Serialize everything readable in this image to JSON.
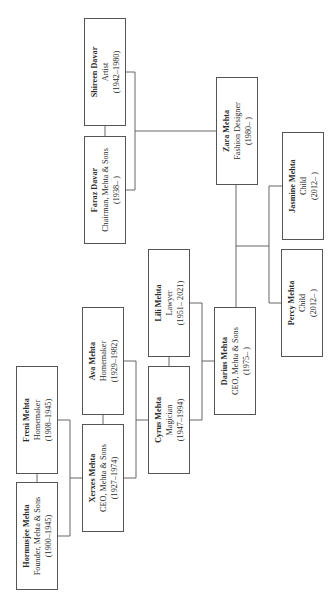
{
  "diagram": {
    "type": "family-tree",
    "orientation": "rotated-90-ccw",
    "line_color": "#555555",
    "box_border_color": "#555555",
    "people": [
      {
        "id": "hormusjee",
        "name": "Hormusjee Mehta",
        "role": "Founder, Mehta & Sons",
        "years": "(1900–1945)",
        "box": {
          "x": 16,
          "y": 482,
          "w": 42,
          "h": 108
        }
      },
      {
        "id": "freni",
        "name": "Freni Mehta",
        "role": "Homemaker",
        "years": "(1908–1945)",
        "box": {
          "x": 16,
          "y": 366,
          "w": 42,
          "h": 108
        }
      },
      {
        "id": "xerxes",
        "name": "Xerxes Mehta",
        "role": "CEO, Mehta & Sons",
        "years": "(1927–1974)",
        "box": {
          "x": 82,
          "y": 424,
          "w": 42,
          "h": 108
        }
      },
      {
        "id": "ava",
        "name": "Ava Mehta",
        "role": "Homemaker",
        "years": "(1929–1982)",
        "box": {
          "x": 82,
          "y": 307,
          "w": 42,
          "h": 108
        }
      },
      {
        "id": "cyrus",
        "name": "Cyrus Mehta",
        "role": "Magician",
        "years": "(1947–1994)",
        "box": {
          "x": 148,
          "y": 366,
          "w": 42,
          "h": 108
        }
      },
      {
        "id": "lili",
        "name": "Lili Mehta",
        "role": "Lawyer",
        "years": "(1951– 2021)",
        "box": {
          "x": 148,
          "y": 249,
          "w": 42,
          "h": 108
        }
      },
      {
        "id": "darius",
        "name": "Darius Mehta",
        "role": "CEO, Mehta & Sons",
        "years": "(1975–   )",
        "box": {
          "x": 214,
          "y": 307,
          "w": 42,
          "h": 108
        }
      },
      {
        "id": "faraz",
        "name": "Faraz Davar",
        "role": "Chairman, Mehta & Sons",
        "years": "(1938–   )",
        "box": {
          "x": 84,
          "y": 136,
          "w": 42,
          "h": 108
        }
      },
      {
        "id": "shireen",
        "name": "Shireen Davar",
        "role": "Artist",
        "years": "(1942–1980)",
        "box": {
          "x": 84,
          "y": 18,
          "w": 42,
          "h": 108
        }
      },
      {
        "id": "zara",
        "name": "Zara Mehta",
        "role": "Fashion Designer",
        "years": "(1980–   )",
        "box": {
          "x": 216,
          "y": 77,
          "w": 42,
          "h": 108
        }
      },
      {
        "id": "jasmine",
        "name": "Jasmine Mehta",
        "role": "Child",
        "years": "(2012–   )",
        "box": {
          "x": 282,
          "y": 132,
          "w": 42,
          "h": 108
        }
      },
      {
        "id": "percy",
        "name": "Percy Mehta",
        "role": "Child",
        "years": "(2012–   )",
        "box": {
          "x": 281,
          "y": 249,
          "w": 42,
          "h": 108
        }
      }
    ],
    "links": [
      {
        "from": "hormusjee",
        "to": "freni",
        "kind": "spouse"
      },
      {
        "from": "xerxes",
        "to": "ava",
        "kind": "spouse"
      },
      {
        "from": "cyrus",
        "to": "lili",
        "kind": "spouse"
      },
      {
        "from": "faraz",
        "to": "shireen",
        "kind": "spouse"
      },
      {
        "from": "darius",
        "to": "zara",
        "kind": "spouse"
      },
      {
        "parents": [
          "hormusjee",
          "freni"
        ],
        "child": "xerxes",
        "kind": "parent-child"
      },
      {
        "parents": [
          "xerxes",
          "ava"
        ],
        "child": "cyrus",
        "kind": "parent-child"
      },
      {
        "parents": [
          "cyrus",
          "lili"
        ],
        "child": "darius",
        "kind": "parent-child"
      },
      {
        "parents": [
          "faraz",
          "shireen"
        ],
        "child": "zara",
        "kind": "parent-child"
      },
      {
        "parents": [
          "darius",
          "zara"
        ],
        "children": [
          "jasmine",
          "percy"
        ],
        "kind": "parent-child"
      }
    ]
  }
}
